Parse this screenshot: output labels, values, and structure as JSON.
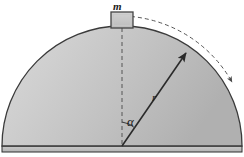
{
  "figure": {
    "background_color": "#ffffff",
    "width": 244,
    "height": 157
  },
  "labels": {
    "mass": "m",
    "radius": "r",
    "angle": "α"
  },
  "dome": {
    "name": "hemisphere",
    "center_x": 122,
    "center_y": 146,
    "radius": 120,
    "fill_light": "#d8d8d8",
    "fill_mid": "#c4c4c4",
    "fill_dark": "#a8a8a8",
    "outline_color": "#3a3a3a",
    "outline_width": 1.2
  },
  "base": {
    "name": "ground-band",
    "top_y": 146,
    "bottom_y": 152,
    "fill": "#bdbdbd",
    "line_color": "#2e2e2e"
  },
  "block": {
    "name": "mass-block",
    "x": 111,
    "y": 12,
    "width": 22,
    "height": 16,
    "fill": "#c9c9c9",
    "border_color": "#444444"
  },
  "vertical_dashed_line": {
    "name": "vertical-axis",
    "from_x": 122,
    "from_y": 28,
    "to_x": 122,
    "to_y": 146,
    "color": "#555555",
    "dash": "4 3"
  },
  "radius_line": {
    "name": "radius-vector",
    "from_x": 122,
    "from_y": 146,
    "to_x": 186,
    "to_y": 53,
    "color": "#2a2a2a",
    "width": 1.6,
    "arrowhead": true
  },
  "motion_arc": {
    "name": "trajectory-arc",
    "color": "#555555",
    "dash": "4 3",
    "arrowhead": true,
    "description": "dashed arc outside the dome showing direction of sliding"
  },
  "angle_arc": {
    "name": "angle-indicator",
    "color": "#3a3a3a",
    "radius": 22
  },
  "colors": {
    "outline": "#3a3a3a",
    "dash": "#555555",
    "text": "#1a1a1a",
    "dome_fill": "#c4c4c4"
  }
}
